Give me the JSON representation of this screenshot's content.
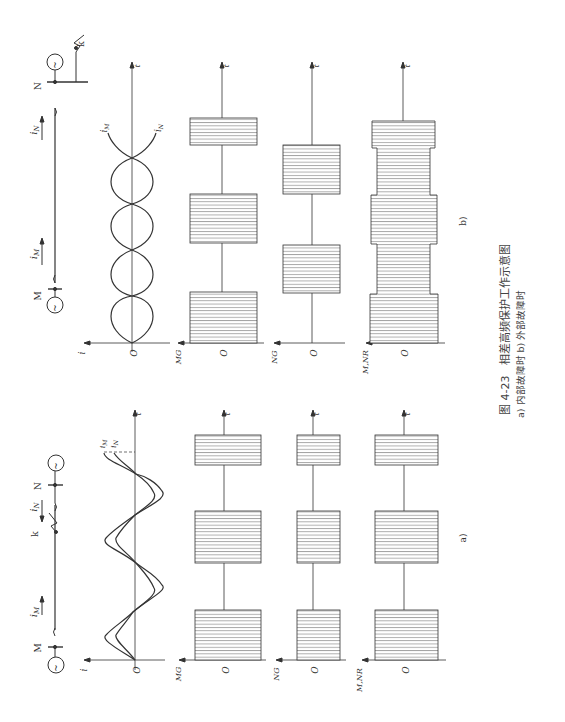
{
  "figure": {
    "number": "图 4-23",
    "title": "相差高频保护工作示意图",
    "subcaption": "a) 内部故障时   b) 外部故障时",
    "orientation": "rotated 90° counter-clockwise"
  },
  "panels": {
    "a": {
      "label": "a)",
      "description": "内部故障时",
      "circuit": {
        "bus_left": "M",
        "bus_right": "N",
        "fault_label": "k",
        "current_left": "i_M",
        "current_right": "i_N",
        "current_left_sub": "M",
        "current_right_sub": "N",
        "source_symbol": "~"
      },
      "plots": [
        {
          "ylabel": "i",
          "xlabel": "t",
          "origin": "O",
          "curves": [
            "i_M",
            "i_N"
          ],
          "curve_label_m": "i",
          "curve_label_m_sub": "M",
          "curve_label_n": "i",
          "curve_label_n_sub": "N"
        },
        {
          "ylabel": "MG",
          "xlabel": "t",
          "origin": "O"
        },
        {
          "ylabel": "NG",
          "xlabel": "t",
          "origin": "O"
        },
        {
          "ylabel": "M,NR",
          "xlabel": "t",
          "origin": "O"
        }
      ]
    },
    "b": {
      "label": "b)",
      "description": "外部故障时",
      "circuit": {
        "bus_left": "M",
        "bus_right": "N",
        "fault_label": "k",
        "current_left": "i_M",
        "current_right": "i_N",
        "current_left_sub": "M",
        "current_right_sub": "N",
        "source_symbol": "~"
      },
      "plots": [
        {
          "ylabel": "i",
          "xlabel": "t",
          "origin": "O",
          "curves": [
            "i_M",
            "i_N"
          ],
          "curve_label_m": "i",
          "curve_label_m_sub": "M",
          "curve_label_n": "i",
          "curve_label_n_sub": "N"
        },
        {
          "ylabel": "MG",
          "xlabel": "t",
          "origin": "O"
        },
        {
          "ylabel": "NG",
          "xlabel": "t",
          "origin": "O"
        },
        {
          "ylabel": "M,NR",
          "xlabel": "t",
          "origin": "O"
        }
      ]
    }
  },
  "colors": {
    "line": "#333333",
    "hatch": "#555555",
    "background": "#ffffff"
  }
}
